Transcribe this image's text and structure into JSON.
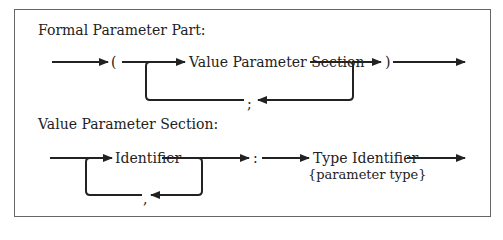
{
  "diagram": {
    "type": "syntax-diagram",
    "colors": {
      "line": "#222222",
      "frame": "#666666",
      "background": "#ffffff"
    },
    "sections": [
      {
        "heading": "Formal Parameter Part:",
        "open_paren": "(",
        "item": "Value Parameter Section",
        "separator": ";",
        "close_paren": ")"
      },
      {
        "heading": "Value Parameter Section:",
        "item": "Identifier",
        "separator": ",",
        "colon": ":",
        "type_item": "Type Identifier",
        "type_note": "{parameter type}"
      }
    ]
  }
}
